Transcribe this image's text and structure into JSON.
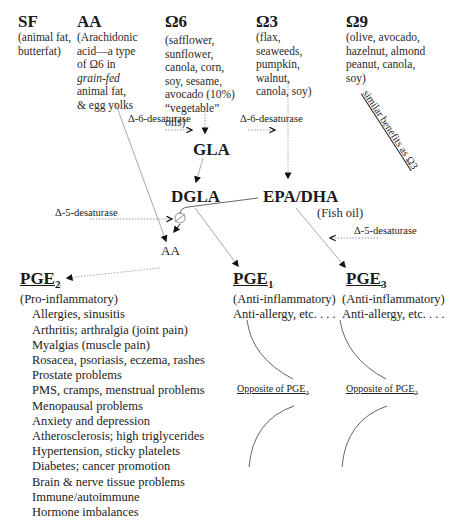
{
  "sources": [
    {
      "id": "sf",
      "title": "SF",
      "lines": [
        "(animal fat,",
        "butterfat)"
      ]
    },
    {
      "id": "aa",
      "title": "AA",
      "lines": [
        "(Arachidonic",
        "acid—a type",
        "of Ω6 in",
        "grain-fed",
        "animal fat,",
        "& egg yolks"
      ],
      "italic_line_index": 3
    },
    {
      "id": "omega6",
      "title": "Ω6",
      "lines": [
        "(safflower,",
        "sunflower,",
        "canola, corn,",
        "soy, sesame,",
        "avocado (10%)",
        "“vegetable”",
        "oils)"
      ]
    },
    {
      "id": "omega3",
      "title": "Ω3",
      "lines": [
        "(flax,",
        "seaweeds,",
        "pumpkin,",
        "walnut,",
        "canola, soy)"
      ]
    },
    {
      "id": "omega9",
      "title": "Ω9",
      "lines": [
        "(olive, avocado,",
        "hazelnut, almond",
        "peanut, canola,",
        "soy)"
      ]
    }
  ],
  "omega9_note": "similar benefits as Ω3",
  "enzymes": {
    "d6_left": "Δ-6-desaturase",
    "d6_right": "Δ-6-desaturase",
    "d5_left": "Δ-5-desaturase",
    "d5_right": "Δ-5-desaturase"
  },
  "nodes": {
    "gla": "GLA",
    "dgla": "DGLA",
    "epa_dha": "EPA/DHA",
    "fish_oil": "(Fish oil)",
    "aa": "AA"
  },
  "prostaglandins": [
    {
      "id": "pge2",
      "name": "PGE",
      "sub": "2",
      "type": "(Pro-inflammatory)",
      "effects": [
        "Allergies, sinusitis",
        "Arthritis; arthralgia (joint pain)",
        "Myalgias (muscle pain)",
        "Rosacea, psoriasis, eczema, rashes",
        "Prostate problems",
        "PMS, cramps, menstrual problems",
        "Menopausal problems",
        "Anxiety and depression",
        "Atherosclerosis; high triglycerides",
        "Hypertension, sticky platelets",
        "Diabetes; cancer promotion",
        "Brain & nerve tissue problems",
        "Immune/autoimmune",
        "Hormone imbalances"
      ]
    },
    {
      "id": "pge1",
      "name": "PGE",
      "sub": "1",
      "type": "(Anti-inflammatory)",
      "effects": [
        "Anti-allergy, etc. . . ."
      ],
      "opposite": "Opposite of PGE",
      "opposite_sub": "2"
    },
    {
      "id": "pge3",
      "name": "PGE",
      "sub": "3",
      "type": "(Anti-inflammatory)",
      "effects": [
        "Anti-allergy, etc. . . ."
      ],
      "opposite": "Opposite of PGE",
      "opposite_sub": "2"
    }
  ]
}
